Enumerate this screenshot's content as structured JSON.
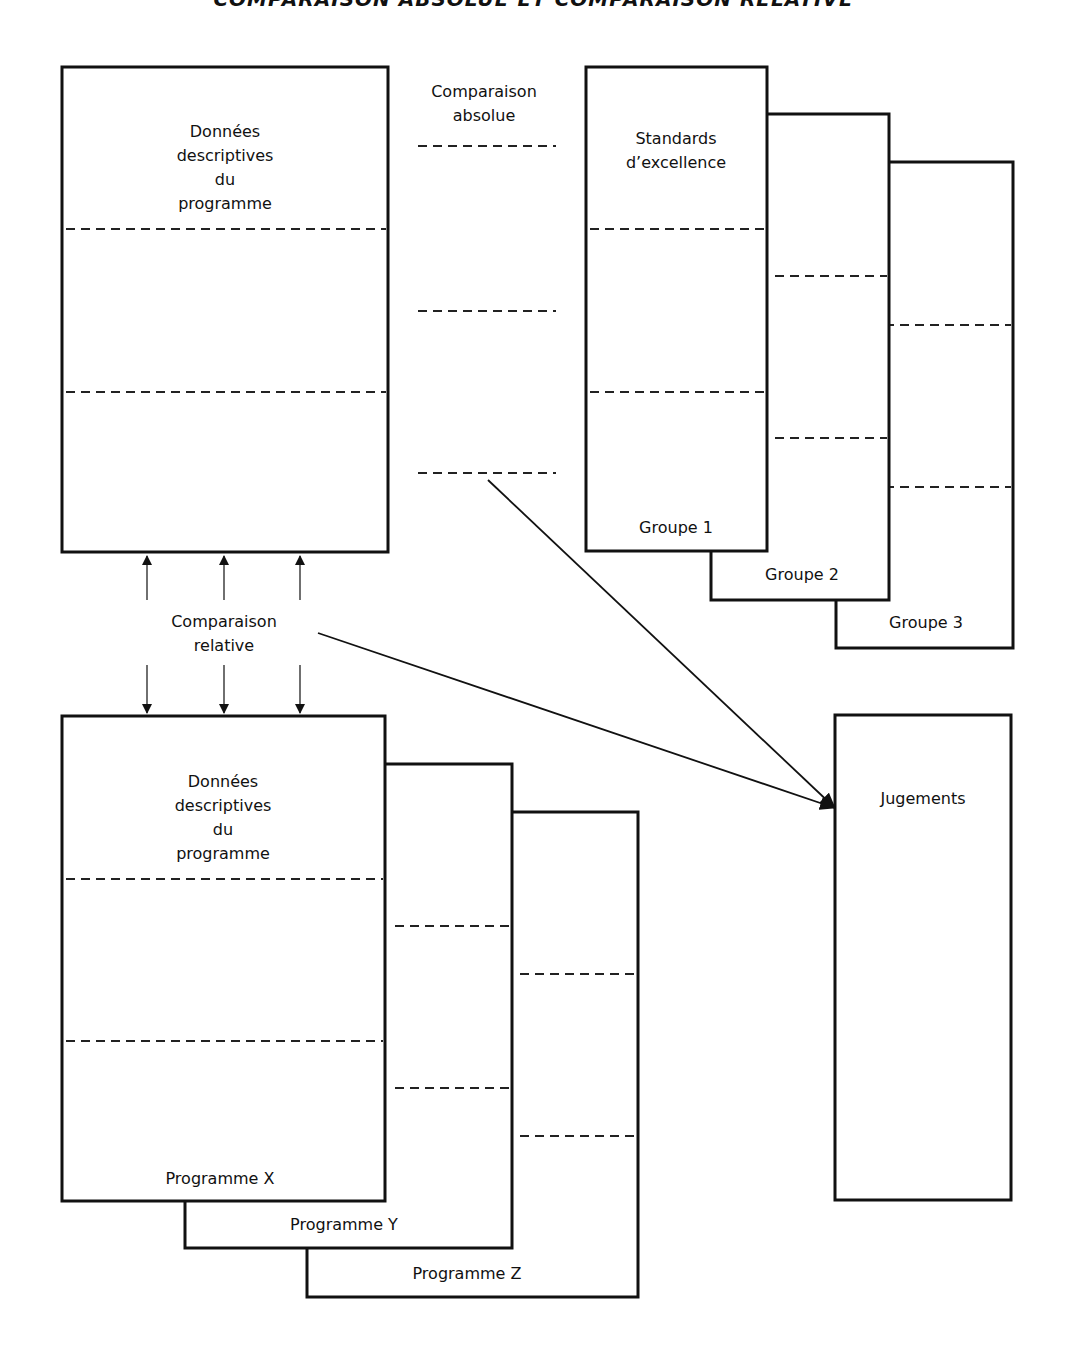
{
  "title": "COMPARAISON ABSOLUE ET COMPARAISON RELATIVE",
  "program_box": {
    "label_lines": [
      "Données",
      "descriptives",
      "du",
      "programme"
    ]
  },
  "absolute_comparison": {
    "label_lines": [
      "Comparaison",
      "absolue"
    ]
  },
  "standards": {
    "label_lines": [
      "Standards",
      "d’excellence"
    ],
    "groups": [
      "Groupe 1",
      "Groupe 2",
      "Groupe 3"
    ]
  },
  "relative_comparison": {
    "label_lines": [
      "Comparaison",
      "relative"
    ]
  },
  "programs": {
    "label_lines": [
      "Données",
      "descriptives",
      "du",
      "programme"
    ],
    "names": [
      "Programme X",
      "Programme Y",
      "Programme Z"
    ]
  },
  "judgements": {
    "label": "Jugements"
  },
  "colors": {
    "stroke": "#111111",
    "background": "#ffffff"
  }
}
